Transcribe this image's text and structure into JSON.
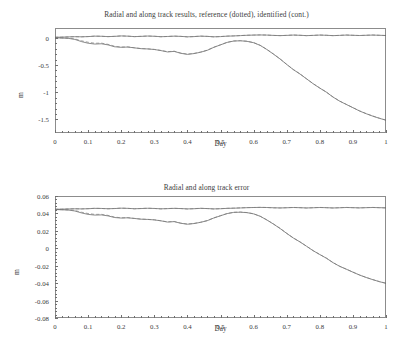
{
  "figure": {
    "width": 413,
    "height": 355,
    "background": "#ffffff",
    "line_color_identified": "#595959",
    "line_color_reference": "#7d7d7d",
    "axis_color": "#8c8c8c"
  },
  "chart_data": [
    {
      "type": "line",
      "title": "Radial and along track results, reference (dotted), identified (cont.)",
      "xlabel": "Day",
      "ylabel": "m",
      "xlim": [
        0,
        1
      ],
      "ylim": [
        -1.75,
        0.18
      ],
      "grid": false,
      "legend": "none",
      "xticks": [
        "0",
        "0.1",
        "0.2",
        "0.3",
        "0.4",
        "0.5",
        "0.6",
        "0.7",
        "0.8",
        "0.9",
        "1"
      ],
      "xtick_values": [
        0,
        0.1,
        0.2,
        0.3,
        0.4,
        0.5,
        0.6,
        0.7,
        0.8,
        0.9,
        1
      ],
      "yticks": [
        "0",
        "-0.5",
        "-1",
        "-1.5"
      ],
      "ytick_values": [
        0,
        -0.5,
        -1,
        -1.5
      ],
      "x": [
        0,
        0.02,
        0.04,
        0.06,
        0.08,
        0.1,
        0.12,
        0.14,
        0.16,
        0.18,
        0.2,
        0.22,
        0.24,
        0.26,
        0.28,
        0.3,
        0.32,
        0.34,
        0.36,
        0.38,
        0.4,
        0.42,
        0.44,
        0.46,
        0.48,
        0.5,
        0.52,
        0.54,
        0.56,
        0.58,
        0.6,
        0.62,
        0.64,
        0.66,
        0.68,
        0.7,
        0.72,
        0.74,
        0.76,
        0.78,
        0.8,
        0.82,
        0.84,
        0.86,
        0.88,
        0.9,
        0.92,
        0.94,
        0.96,
        0.98,
        1
      ],
      "series": [
        {
          "name": "radial-identified",
          "style": "continuous",
          "values": [
            0.01,
            0.012,
            0.016,
            0.02,
            0.018,
            0.022,
            0.03,
            0.028,
            0.022,
            0.026,
            0.034,
            0.03,
            0.022,
            0.026,
            0.032,
            0.028,
            0.02,
            0.024,
            0.03,
            0.026,
            0.018,
            0.022,
            0.03,
            0.026,
            0.018,
            0.022,
            0.03,
            0.034,
            0.04,
            0.046,
            0.05,
            0.052,
            0.05,
            0.044,
            0.04,
            0.044,
            0.05,
            0.046,
            0.04,
            0.044,
            0.05,
            0.046,
            0.04,
            0.044,
            0.05,
            0.046,
            0.042,
            0.046,
            0.05,
            0.046,
            0.042
          ]
        },
        {
          "name": "radial-reference",
          "style": "dotted",
          "values": [
            0.01,
            0.012,
            0.017,
            0.021,
            0.018,
            0.023,
            0.031,
            0.028,
            0.021,
            0.027,
            0.035,
            0.03,
            0.021,
            0.027,
            0.033,
            0.028,
            0.019,
            0.025,
            0.031,
            0.026,
            0.017,
            0.023,
            0.031,
            0.026,
            0.017,
            0.023,
            0.031,
            0.035,
            0.041,
            0.047,
            0.05,
            0.053,
            0.05,
            0.043,
            0.04,
            0.045,
            0.051,
            0.046,
            0.039,
            0.045,
            0.051,
            0.046,
            0.039,
            0.045,
            0.051,
            0.046,
            0.041,
            0.047,
            0.051,
            0.046,
            0.041
          ]
        },
        {
          "name": "along-track-identified",
          "style": "continuous",
          "values": [
            0.0,
            -0.005,
            -0.01,
            -0.03,
            -0.07,
            -0.1,
            -0.115,
            -0.11,
            -0.13,
            -0.165,
            -0.175,
            -0.17,
            -0.185,
            -0.2,
            -0.205,
            -0.215,
            -0.235,
            -0.26,
            -0.25,
            -0.285,
            -0.305,
            -0.29,
            -0.265,
            -0.23,
            -0.175,
            -0.13,
            -0.085,
            -0.06,
            -0.055,
            -0.065,
            -0.09,
            -0.14,
            -0.215,
            -0.3,
            -0.39,
            -0.49,
            -0.585,
            -0.665,
            -0.755,
            -0.845,
            -0.925,
            -1.0,
            -1.09,
            -1.165,
            -1.225,
            -1.285,
            -1.345,
            -1.395,
            -1.44,
            -1.48,
            -1.515
          ]
        },
        {
          "name": "along-track-reference",
          "style": "dotted",
          "values": [
            0.0,
            -0.004,
            -0.009,
            -0.02,
            -0.055,
            -0.082,
            -0.1,
            -0.098,
            -0.12,
            -0.155,
            -0.17,
            -0.168,
            -0.183,
            -0.198,
            -0.203,
            -0.213,
            -0.232,
            -0.255,
            -0.246,
            -0.28,
            -0.3,
            -0.287,
            -0.262,
            -0.228,
            -0.173,
            -0.128,
            -0.083,
            -0.058,
            -0.053,
            -0.063,
            -0.088,
            -0.138,
            -0.213,
            -0.298,
            -0.388,
            -0.488,
            -0.583,
            -0.663,
            -0.753,
            -0.843,
            -0.923,
            -0.998,
            -1.088,
            -1.163,
            -1.223,
            -1.283,
            -1.343,
            -1.393,
            -1.438,
            -1.478,
            -1.513
          ]
        }
      ]
    },
    {
      "type": "line",
      "title": "Radial and along track error",
      "xlabel": "Day",
      "ylabel": "m",
      "xlim": [
        0,
        1
      ],
      "ylim": [
        -0.08,
        0.06
      ],
      "grid": false,
      "legend": "none",
      "xticks": [
        "0",
        "0.1",
        "0.2",
        "0.3",
        "0.4",
        "0.5",
        "0.6",
        "0.7",
        "0.8",
        "0.9",
        "1"
      ],
      "xtick_values": [
        0,
        0.1,
        0.2,
        0.3,
        0.4,
        0.5,
        0.6,
        0.7,
        0.8,
        0.9,
        1
      ],
      "yticks": [
        "0.06",
        "0.04",
        "0.02",
        "0",
        "-0.02",
        "-0.04",
        "-0.06",
        "-0.08"
      ],
      "ytick_values": [
        0.06,
        0.04,
        0.02,
        0,
        -0.02,
        -0.04,
        -0.06,
        -0.08
      ],
      "x": [
        0,
        0.02,
        0.04,
        0.06,
        0.08,
        0.1,
        0.12,
        0.14,
        0.16,
        0.18,
        0.2,
        0.22,
        0.24,
        0.26,
        0.28,
        0.3,
        0.32,
        0.34,
        0.36,
        0.38,
        0.4,
        0.42,
        0.44,
        0.46,
        0.48,
        0.5,
        0.52,
        0.54,
        0.56,
        0.58,
        0.6,
        0.62,
        0.64,
        0.66,
        0.68,
        0.7,
        0.72,
        0.74,
        0.76,
        0.78,
        0.8,
        0.82,
        0.84,
        0.86,
        0.88,
        0.9,
        0.92,
        0.94,
        0.96,
        0.98,
        1
      ],
      "series": [
        {
          "name": "radial-error-identified",
          "style": "continuous",
          "values": [
            0.0448,
            0.0449,
            0.0451,
            0.0453,
            0.0452,
            0.0454,
            0.0458,
            0.0457,
            0.0454,
            0.0456,
            0.046,
            0.0458,
            0.0454,
            0.0456,
            0.0459,
            0.0457,
            0.0453,
            0.0455,
            0.0458,
            0.0456,
            0.0452,
            0.0454,
            0.0458,
            0.0456,
            0.0452,
            0.0454,
            0.0458,
            0.046,
            0.0463,
            0.0466,
            0.0468,
            0.0469,
            0.0468,
            0.0465,
            0.0463,
            0.0465,
            0.0468,
            0.0466,
            0.0463,
            0.0465,
            0.0468,
            0.0466,
            0.0463,
            0.0465,
            0.0468,
            0.0466,
            0.0464,
            0.0466,
            0.0468,
            0.0466,
            0.0464
          ]
        },
        {
          "name": "radial-error-reference",
          "style": "dotted",
          "values": [
            0.0448,
            0.0449,
            0.0452,
            0.0454,
            0.0452,
            0.0455,
            0.0459,
            0.0457,
            0.0453,
            0.0457,
            0.0461,
            0.0458,
            0.0453,
            0.0457,
            0.046,
            0.0457,
            0.0452,
            0.0456,
            0.0459,
            0.0456,
            0.0451,
            0.0455,
            0.0459,
            0.0456,
            0.0451,
            0.0455,
            0.0459,
            0.0461,
            0.0464,
            0.0467,
            0.0468,
            0.047,
            0.0468,
            0.0464,
            0.0463,
            0.0466,
            0.0469,
            0.0466,
            0.0462,
            0.0466,
            0.0469,
            0.0466,
            0.0462,
            0.0466,
            0.0469,
            0.0466,
            0.0463,
            0.0467,
            0.0469,
            0.0466,
            0.0463
          ]
        },
        {
          "name": "along-track-error-identified",
          "style": "continuous",
          "values": [
            0.0445,
            0.0442,
            0.0439,
            0.0428,
            0.0406,
            0.0389,
            0.0381,
            0.0383,
            0.0372,
            0.0353,
            0.0347,
            0.035,
            0.0342,
            0.0334,
            0.0331,
            0.0326,
            0.0315,
            0.0301,
            0.0306,
            0.0287,
            0.0276,
            0.0284,
            0.0298,
            0.0317,
            0.0348,
            0.0373,
            0.0398,
            0.0412,
            0.0414,
            0.0409,
            0.0395,
            0.0367,
            0.0325,
            0.0278,
            0.0227,
            0.0171,
            0.0118,
            0.0073,
            0.0023,
            -0.0028,
            -0.0072,
            -0.0114,
            -0.0165,
            -0.0207,
            -0.024,
            -0.0274,
            -0.0307,
            -0.0335,
            -0.036,
            -0.0383,
            -0.0402
          ]
        },
        {
          "name": "along-track-error-reference",
          "style": "dotted",
          "values": [
            0.0445,
            0.0443,
            0.044,
            0.0434,
            0.0414,
            0.0399,
            0.0389,
            0.039,
            0.0378,
            0.0358,
            0.035,
            0.0351,
            0.0343,
            0.0335,
            0.0332,
            0.0327,
            0.0316,
            0.0303,
            0.0308,
            0.0289,
            0.0278,
            0.0285,
            0.0299,
            0.0318,
            0.0349,
            0.0374,
            0.0399,
            0.0413,
            0.0416,
            0.041,
            0.0396,
            0.0368,
            0.0326,
            0.0279,
            0.0229,
            0.0172,
            0.0119,
            0.0074,
            0.0024,
            -0.0027,
            -0.0071,
            -0.0113,
            -0.0164,
            -0.0206,
            -0.0239,
            -0.0273,
            -0.0306,
            -0.0334,
            -0.0359,
            -0.0382,
            -0.0401
          ]
        }
      ]
    }
  ]
}
